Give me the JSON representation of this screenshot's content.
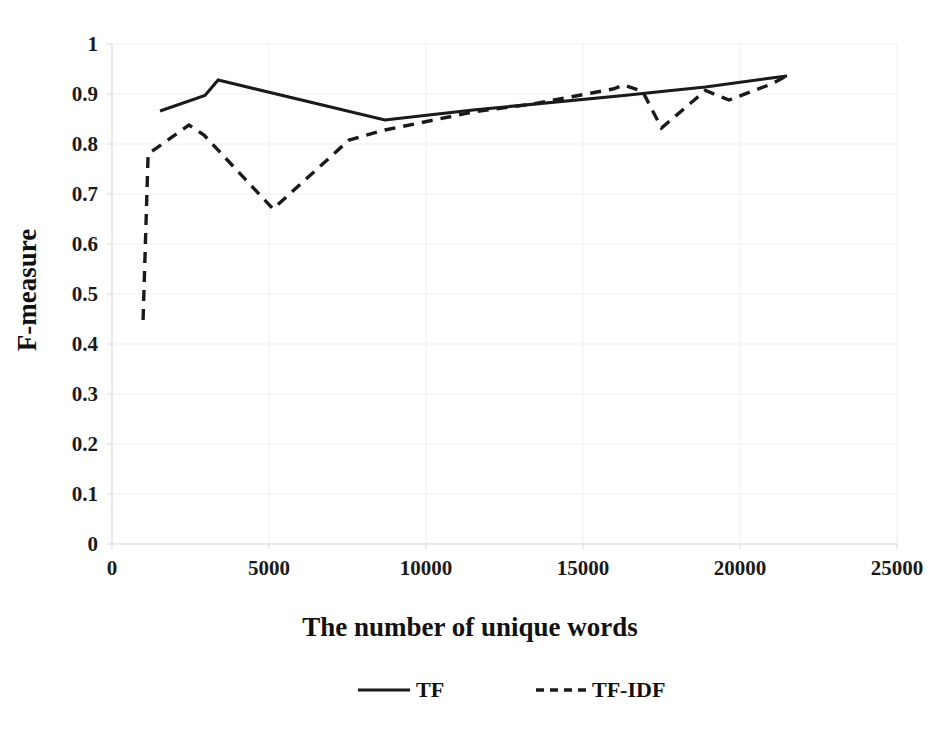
{
  "chart_data": {
    "type": "line",
    "title": "",
    "xlabel": "The number of unique words",
    "ylabel": "F-measure",
    "xlim": [
      0,
      25000
    ],
    "ylim": [
      0,
      1
    ],
    "xticks": [
      "0",
      "5000",
      "10000",
      "15000",
      "20000",
      "25000"
    ],
    "xtick_values": [
      0,
      5000,
      10000,
      15000,
      20000,
      25000
    ],
    "yticks": [
      "0",
      "0.1",
      "0.2",
      "0.3",
      "0.4",
      "0.5",
      "0.6",
      "0.7",
      "0.8",
      "0.9",
      "1"
    ],
    "ytick_values": [
      0,
      0.1,
      0.2,
      0.3,
      0.4,
      0.5,
      0.6,
      0.7,
      0.8,
      0.9,
      1
    ],
    "grid": true,
    "legend_position": "bottom",
    "series": [
      {
        "name": "TF",
        "style": "solid",
        "color": "#1a1a1a",
        "x": [
          1530,
          2960,
          3380,
          8690,
          11500,
          16300,
          17500,
          18900,
          21000,
          21500
        ],
        "y": [
          0.866,
          0.897,
          0.928,
          0.848,
          0.868,
          0.897,
          0.905,
          0.914,
          0.932,
          0.936
        ]
      },
      {
        "name": "TF-IDF",
        "style": "dashed",
        "color": "#1a1a1a",
        "x": [
          990,
          1150,
          2450,
          2930,
          5130,
          7550,
          8690,
          11500,
          13400,
          15950,
          16300,
          16900,
          17500,
          18900,
          19650,
          21000,
          21500
        ],
        "y": [
          0.448,
          0.78,
          0.838,
          0.818,
          0.67,
          0.808,
          0.828,
          0.864,
          0.88,
          0.91,
          0.918,
          0.905,
          0.832,
          0.907,
          0.888,
          0.92,
          0.937
        ]
      }
    ]
  },
  "legend": {
    "items": [
      {
        "label": "TF",
        "style": "solid"
      },
      {
        "label": "TF-IDF",
        "style": "dashed"
      }
    ]
  }
}
